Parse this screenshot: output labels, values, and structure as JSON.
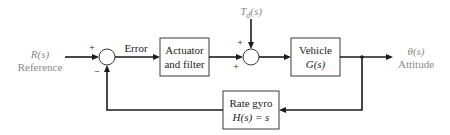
{
  "diagram": {
    "type": "feedback-control-block-diagram",
    "input": {
      "signal": "R(s)",
      "name": "Reference"
    },
    "disturbance": {
      "signal": "T_d(s)",
      "symbol": "T",
      "subscript": "d",
      "arg": "(s)"
    },
    "output": {
      "signal": "θ(s)",
      "name": "Attitude"
    },
    "error_label": "Error",
    "junctions": [
      {
        "id": "sum1",
        "signs": {
          "left": "+",
          "bottom": "−"
        }
      },
      {
        "id": "sum2",
        "signs": {
          "top": "+",
          "left": "+"
        }
      }
    ],
    "blocks": [
      {
        "id": "actuator",
        "line1": "Actuator",
        "line2": "and filter"
      },
      {
        "id": "vehicle",
        "line1": "Vehicle",
        "line2": "G(s)"
      },
      {
        "id": "rate_gyro",
        "line1": "Rate gyro",
        "line2": "H(s) = s"
      }
    ],
    "edges": [
      {
        "from": "R(s)",
        "to": "sum1"
      },
      {
        "from": "sum1",
        "to": "actuator",
        "label": "Error"
      },
      {
        "from": "actuator",
        "to": "sum2"
      },
      {
        "from": "T_d(s)",
        "to": "sum2"
      },
      {
        "from": "sum2",
        "to": "vehicle"
      },
      {
        "from": "vehicle",
        "to": "θ(s)"
      },
      {
        "from": "θ(s)",
        "to": "rate_gyro",
        "type": "feedback"
      },
      {
        "from": "rate_gyro",
        "to": "sum1",
        "type": "feedback"
      }
    ]
  }
}
